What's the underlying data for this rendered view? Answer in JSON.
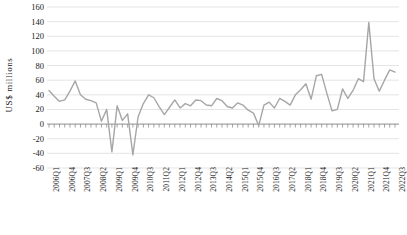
{
  "chart_data": {
    "type": "line",
    "title": "",
    "xlabel": "",
    "ylabel": "US$ millions",
    "ylim": [
      -60,
      160
    ],
    "ytick_values": [
      160,
      140,
      120,
      100,
      80,
      60,
      40,
      20,
      0,
      -20,
      -40,
      -60
    ],
    "ytick_labels": [
      "160",
      "140",
      "120",
      "100",
      "80",
      "60",
      "40",
      "20",
      "0",
      "-20",
      "-40",
      "-60"
    ],
    "grid": true,
    "grid_axis": "y",
    "legend": false,
    "legend_position": "none",
    "line_color": "#a6a6a6",
    "grid_color": "#d9d9d9",
    "axis_color": "#808080",
    "x_label_rotation": 90,
    "x_label_interval": 3,
    "categories": [
      "2006Q1",
      "2006Q2",
      "2006Q3",
      "2006Q4",
      "2007Q1",
      "2007Q2",
      "2007Q3",
      "2007Q4",
      "2008Q1",
      "2008Q2",
      "2008Q3",
      "2008Q4",
      "2009Q1",
      "2009Q2",
      "2009Q3",
      "2009Q4",
      "2010Q1",
      "2010Q2",
      "2010Q3",
      "2010Q4",
      "2011Q1",
      "2011Q2",
      "2011Q3",
      "2011Q4",
      "2012Q1",
      "2012Q2",
      "2012Q3",
      "2012Q4",
      "2013Q1",
      "2013Q2",
      "2013Q3",
      "2013Q4",
      "2014Q1",
      "2014Q2",
      "2014Q3",
      "2014Q4",
      "2015Q1",
      "2015Q2",
      "2015Q3",
      "2015Q4",
      "2016Q1",
      "2016Q2",
      "2016Q3",
      "2016Q4",
      "2017Q1",
      "2017Q2",
      "2017Q3",
      "2017Q4",
      "2018Q1",
      "2018Q2",
      "2018Q3",
      "2018Q4",
      "2019Q1",
      "2019Q2",
      "2019Q3",
      "2019Q4",
      "2020Q1",
      "2020Q2",
      "2020Q3",
      "2020Q4",
      "2021Q1",
      "2021Q2",
      "2021Q3",
      "2021Q4",
      "2022Q1",
      "2022Q2",
      "2022Q3"
    ],
    "labeled_categories": [
      "2006Q1",
      "2006Q4",
      "2007Q3",
      "2008Q2",
      "2009Q1",
      "2009Q4",
      "2010Q3",
      "2011Q2",
      "2012Q1",
      "2012Q4",
      "2013Q3",
      "2014Q2",
      "2015Q1",
      "2015Q4",
      "2016Q3",
      "2017Q2",
      "2018Q1",
      "2018Q4",
      "2019Q3",
      "2020Q2",
      "2021Q1",
      "2021Q4",
      "2022Q3"
    ],
    "values": [
      46,
      38,
      31,
      33,
      45,
      59,
      40,
      34,
      32,
      29,
      4,
      20,
      -38,
      25,
      5,
      14,
      -42,
      10,
      28,
      40,
      36,
      24,
      13,
      23,
      33,
      22,
      28,
      25,
      33,
      32,
      26,
      25,
      35,
      32,
      24,
      22,
      29,
      26,
      19,
      15,
      -2,
      26,
      30,
      22,
      35,
      31,
      26,
      40,
      47,
      55,
      34,
      66,
      68,
      42,
      18,
      20,
      48,
      35,
      46,
      62,
      58,
      139,
      62,
      45,
      60,
      74,
      71
    ]
  }
}
